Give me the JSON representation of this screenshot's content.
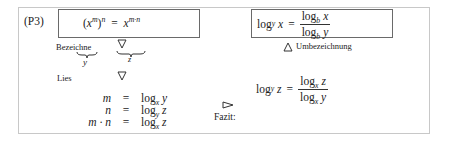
{
  "label": "(P3)",
  "left_box": {
    "formula_base": "x",
    "formula_inner_exp": "m",
    "formula_outer_exp": "n",
    "formula_eq": "=",
    "formula_rhs_base": "x",
    "formula_rhs_exp": "m·n"
  },
  "right_box": {
    "lhs_log": "log",
    "lhs_sub": "y",
    "lhs_arg": "x",
    "eq": "=",
    "num_log": "log",
    "num_sub": "b",
    "num_arg": "x",
    "den_log": "log",
    "den_sub": "b",
    "den_arg": "y"
  },
  "bezeichne_label": "Bezeichne",
  "brace_y_label": "y",
  "brace_z_label": "z",
  "lies_label": "Lies",
  "umbezeichnung_label": "Umbezeichnung",
  "equations": [
    {
      "lhs": "m",
      "eq": "=",
      "log": "log",
      "sub": "x",
      "arg": "y"
    },
    {
      "lhs": "n",
      "eq": "=",
      "log": "log",
      "sub": "y",
      "arg": "z"
    },
    {
      "lhs": "m · n",
      "eq": "=",
      "log": "log",
      "sub": "x",
      "arg": "z"
    }
  ],
  "fazit_label": "Fazit:",
  "conclusion": {
    "lhs_log": "log",
    "lhs_sub": "y",
    "lhs_arg": "z",
    "eq": "=",
    "num_log": "log",
    "num_sub": "x",
    "num_arg": "z",
    "den_log": "log",
    "den_sub": "x",
    "den_arg": "y"
  }
}
